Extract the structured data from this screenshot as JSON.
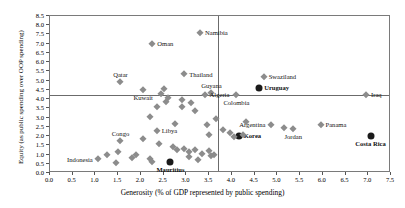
{
  "chart_data": {
    "type": "scatter",
    "title": "",
    "xlabel": "Generosity (% of GDP represented by public spending)",
    "ylabel": "Equity (as public spending over OOP spending)",
    "xlim": [
      0.0,
      7.5
    ],
    "ylim": [
      0.0,
      8.5
    ],
    "xticks": [
      "0.0",
      "0.5",
      "1.0",
      "1.5",
      "2.0",
      "2.5",
      "3.0",
      "3.5",
      "4.0",
      "4.5",
      "5.0",
      "5.5",
      "6.0",
      "6.5",
      "7.0",
      "7.5"
    ],
    "yticks": [
      "0.0",
      "0.5",
      "1.0",
      "1.5",
      "2.0",
      "2.5",
      "3.0",
      "3.5",
      "4.0",
      "4.5",
      "5.0",
      "5.5",
      "6.0",
      "6.5",
      "7.0",
      "7.5",
      "8.0",
      "8.5"
    ],
    "grid": false,
    "legend": "none",
    "reference_lines": {
      "horizontal_y": 4.25,
      "vertical_x": 3.7
    },
    "marker_styles": {
      "default": {
        "shape": "diamond",
        "color": "#8c8c8c"
      },
      "highlighted": {
        "shape": "circle",
        "color": "#1a1a1a"
      }
    },
    "points": [
      {
        "label": "Namibia",
        "x": 3.3,
        "y": 7.6,
        "style": "default",
        "label_pos": "right"
      },
      {
        "label": "Oman",
        "x": 2.25,
        "y": 7.0,
        "style": "default",
        "label_pos": "right"
      },
      {
        "label": "Qatar",
        "x": 1.55,
        "y": 4.9,
        "style": "default",
        "label_pos": "above"
      },
      {
        "label": "Thailand",
        "x": 2.95,
        "y": 5.35,
        "style": "default",
        "label_pos": "right"
      },
      {
        "label": "Kuwait",
        "x": 2.05,
        "y": 4.5,
        "style": "default",
        "label_pos": "below"
      },
      {
        "label": "Guyana",
        "x": 3.55,
        "y": 4.35,
        "style": "default",
        "label_pos": "above"
      },
      {
        "label": "Swaziland",
        "x": 4.7,
        "y": 5.2,
        "style": "default",
        "label_pos": "right"
      },
      {
        "label": "Uruguay",
        "x": 4.6,
        "y": 4.6,
        "style": "highlighted",
        "label_pos": "right"
      },
      {
        "label": "Algeria",
        "x": 3.4,
        "y": 4.25,
        "style": "default",
        "label_pos": "right"
      },
      {
        "label": "Colombia",
        "x": 4.1,
        "y": 4.25,
        "style": "default",
        "label_pos": "below"
      },
      {
        "label": "Iraq",
        "x": 6.95,
        "y": 4.25,
        "style": "default",
        "label_pos": "right"
      },
      {
        "label": "Congo",
        "x": 1.55,
        "y": 1.75,
        "style": "default",
        "label_pos": "above"
      },
      {
        "label": "Libya",
        "x": 2.35,
        "y": 2.3,
        "style": "default",
        "label_pos": "right"
      },
      {
        "label": "Argentina",
        "x": 4.85,
        "y": 2.6,
        "style": "default",
        "label_pos": "left"
      },
      {
        "label": "Panama",
        "x": 5.95,
        "y": 2.6,
        "style": "default",
        "label_pos": "right"
      },
      {
        "label": "Jordan",
        "x": 5.35,
        "y": 2.4,
        "style": "default",
        "label_pos": "below"
      },
      {
        "label": "Korea",
        "x": 4.15,
        "y": 2.0,
        "style": "highlighted",
        "label_pos": "right"
      },
      {
        "label": "Costa Rica",
        "x": 7.05,
        "y": 2.0,
        "style": "highlighted",
        "label_pos": "below"
      },
      {
        "label": "Indonesia",
        "x": 1.05,
        "y": 0.75,
        "style": "default",
        "label_pos": "left"
      },
      {
        "label": "Mauritius",
        "x": 2.65,
        "y": 0.6,
        "style": "highlighted",
        "label_pos": "below"
      },
      {
        "label": "",
        "x": 2.5,
        "y": 4.55,
        "style": "default"
      },
      {
        "label": "",
        "x": 2.45,
        "y": 4.3,
        "style": "default"
      },
      {
        "label": "",
        "x": 2.6,
        "y": 4.05,
        "style": "default"
      },
      {
        "label": "",
        "x": 2.55,
        "y": 3.85,
        "style": "default"
      },
      {
        "label": "",
        "x": 2.35,
        "y": 3.55,
        "style": "default"
      },
      {
        "label": "",
        "x": 2.9,
        "y": 3.95,
        "style": "default"
      },
      {
        "label": "",
        "x": 2.9,
        "y": 3.55,
        "style": "default"
      },
      {
        "label": "",
        "x": 3.1,
        "y": 3.8,
        "style": "default"
      },
      {
        "label": "",
        "x": 3.2,
        "y": 3.35,
        "style": "default"
      },
      {
        "label": "",
        "x": 2.2,
        "y": 3.05,
        "style": "default"
      },
      {
        "label": "",
        "x": 2.75,
        "y": 2.65,
        "style": "default"
      },
      {
        "label": "",
        "x": 3.45,
        "y": 2.6,
        "style": "default"
      },
      {
        "label": "",
        "x": 3.5,
        "y": 2.05,
        "style": "default"
      },
      {
        "label": "",
        "x": 2.05,
        "y": 1.85,
        "style": "default"
      },
      {
        "label": "",
        "x": 2.4,
        "y": 1.55,
        "style": "default"
      },
      {
        "label": "",
        "x": 2.7,
        "y": 1.4,
        "style": "default"
      },
      {
        "label": "",
        "x": 2.8,
        "y": 1.25,
        "style": "default"
      },
      {
        "label": "",
        "x": 2.95,
        "y": 1.3,
        "style": "default"
      },
      {
        "label": "",
        "x": 3.05,
        "y": 1.15,
        "style": "default"
      },
      {
        "label": "",
        "x": 3.2,
        "y": 1.25,
        "style": "default"
      },
      {
        "label": "",
        "x": 3.35,
        "y": 1.05,
        "style": "default"
      },
      {
        "label": "",
        "x": 3.5,
        "y": 1.2,
        "style": "default"
      },
      {
        "label": "",
        "x": 3.6,
        "y": 1.0,
        "style": "default"
      },
      {
        "label": "",
        "x": 3.05,
        "y": 0.85,
        "style": "default"
      },
      {
        "label": "",
        "x": 3.25,
        "y": 0.7,
        "style": "default"
      },
      {
        "label": "",
        "x": 2.2,
        "y": 0.75,
        "style": "default"
      },
      {
        "label": "",
        "x": 2.25,
        "y": 0.6,
        "style": "default"
      },
      {
        "label": "",
        "x": 1.9,
        "y": 0.95,
        "style": "default"
      },
      {
        "label": "",
        "x": 1.8,
        "y": 0.8,
        "style": "default"
      },
      {
        "label": "",
        "x": 1.45,
        "y": 0.55,
        "style": "default"
      },
      {
        "label": "",
        "x": 1.5,
        "y": 1.15,
        "style": "default"
      },
      {
        "label": "",
        "x": 1.25,
        "y": 0.95,
        "style": "default"
      },
      {
        "label": "",
        "x": 3.65,
        "y": 2.95,
        "style": "default"
      },
      {
        "label": "",
        "x": 3.8,
        "y": 2.35,
        "style": "default"
      },
      {
        "label": "",
        "x": 3.95,
        "y": 2.15,
        "style": "default"
      },
      {
        "label": "",
        "x": 4.05,
        "y": 1.95,
        "style": "default"
      },
      {
        "label": "",
        "x": 4.25,
        "y": 2.05,
        "style": "default"
      },
      {
        "label": "",
        "x": 4.3,
        "y": 2.75,
        "style": "default"
      },
      {
        "label": "",
        "x": 5.15,
        "y": 2.45,
        "style": "default"
      },
      {
        "label": "",
        "x": 3.55,
        "y": 0.9,
        "style": "default"
      }
    ]
  }
}
